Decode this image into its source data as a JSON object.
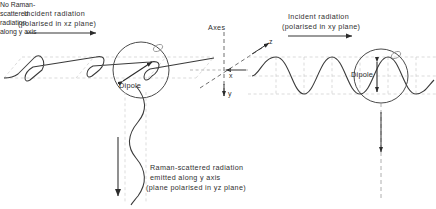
{
  "figure": {
    "title_text": "Raman scattering polarisation diagram",
    "background": "#ffffff",
    "ink_color": "#2b2b2b",
    "construction_color": "#c9c9c9"
  },
  "labels": {
    "incident_left_line1": "Incident radiation",
    "incident_left_line2": "(polarised in xz plane)",
    "incident_right_line1": "Incident radiation",
    "incident_right_line2": "(polarised in xy plane)",
    "axes_caption": "Axes",
    "axis_z": "z",
    "axis_x": "x",
    "axis_y": "y",
    "dipole_left": "Dipole",
    "dipole_right": "Dipole",
    "scattered_line1": "Raman-scattered radiation",
    "scattered_line2": "emitted along y axis",
    "scattered_line3": "(plane polarised in yz plane)",
    "no_raman_line1": "No Raman-",
    "no_raman_line2": "scattered",
    "no_raman_line3": "radiation",
    "no_raman_line4": "along y axis"
  },
  "geometry": {
    "left_circle": {
      "cx": 141,
      "cy": 70,
      "r": 28
    },
    "right_circle": {
      "cx": 381,
      "cy": 76,
      "r": 27
    },
    "axes_origin": {
      "x": 224,
      "y": 70
    },
    "left_dipole_arrow": "diagonal double-headed",
    "right_dipole_arrow": "vertical double-headed",
    "scattered_beam_axis": "downward along y from left dipole",
    "right_beam_axis": "downward dashed along y from right dipole"
  }
}
